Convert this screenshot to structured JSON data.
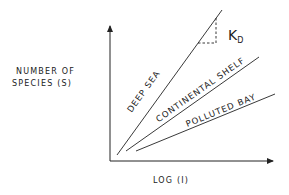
{
  "diagram": {
    "y_axis_label_line1": "NUMBER OF",
    "y_axis_label_line2": "SPECIES (S)",
    "x_axis_label": "LOG (I)",
    "slope_label_main": "K",
    "slope_label_sub": "D",
    "lines": [
      {
        "label": "DEEP SEA"
      },
      {
        "label": "CONTINENTAL SHELF"
      },
      {
        "label": "POLLUTED BAY"
      }
    ],
    "line_color": "#222222"
  }
}
